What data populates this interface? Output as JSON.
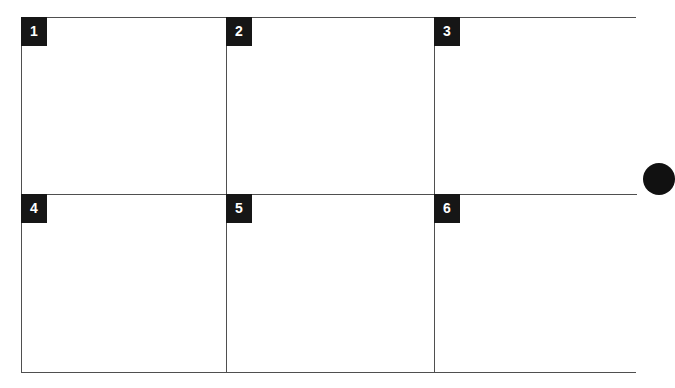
{
  "page": {
    "background_color": "#ffffff",
    "border_color": "#4f4f4f",
    "badge_color": "#161616",
    "badge_text_color": "#ffffff",
    "bullet_color": "#111111"
  },
  "grid": {
    "rows": 2,
    "columns": 3,
    "cells": [
      {
        "badge": "1",
        "content": ""
      },
      {
        "badge": "2",
        "content": ""
      },
      {
        "badge": "3",
        "content": ""
      },
      {
        "badge": "4",
        "content": ""
      },
      {
        "badge": "5",
        "content": ""
      },
      {
        "badge": "6",
        "content": ""
      }
    ]
  },
  "bullet": {
    "shape": "filled-ellipse",
    "label": ""
  }
}
